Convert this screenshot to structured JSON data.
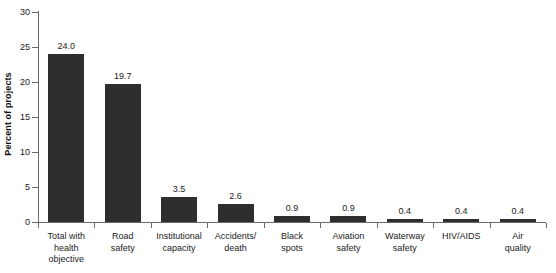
{
  "chart_data": {
    "type": "bar",
    "title": "",
    "xlabel": "",
    "ylabel": "Percent of projects",
    "ylim": [
      0,
      30
    ],
    "yticks": [
      0,
      5,
      10,
      15,
      20,
      25,
      30
    ],
    "ytick_labels": [
      "0",
      "5",
      "10",
      "15",
      "20",
      "25",
      "30"
    ],
    "grid": false,
    "legend": false,
    "bar_color": "#2e2e2e",
    "axis_color": "#6a6a6a",
    "categories": [
      "Total with health objective",
      "Road safety",
      "Institutional capacity",
      "Accidents/ death",
      "Black spots",
      "Aviation safety",
      "Waterway safety",
      "HIV/AIDS",
      "Air quality"
    ],
    "category_lines": [
      [
        "Total with",
        "health",
        "objective"
      ],
      [
        "Road",
        "safety"
      ],
      [
        "Institutional",
        "capacity"
      ],
      [
        "Accidents/",
        "death"
      ],
      [
        "Black",
        "spots"
      ],
      [
        "Aviation",
        "safety"
      ],
      [
        "Waterway",
        "safety"
      ],
      [
        "HIV/AIDS"
      ],
      [
        "Air",
        "quality"
      ]
    ],
    "values": [
      24.0,
      19.7,
      3.5,
      2.6,
      0.9,
      0.9,
      0.4,
      0.4,
      0.4
    ],
    "value_labels": [
      "24.0",
      "19.7",
      "3.5",
      "2.6",
      "0.9",
      "0.9",
      "0.4",
      "0.4",
      "0.4"
    ]
  }
}
